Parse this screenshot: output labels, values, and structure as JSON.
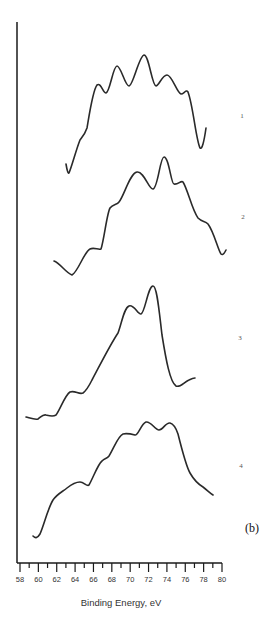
{
  "chart_data": {
    "type": "line",
    "title": "",
    "panel_label": "(b)",
    "xlabel": "Binding Energy, eV",
    "ylabel": "",
    "xlim": [
      58,
      80
    ],
    "x_ticks": [
      58,
      60,
      62,
      64,
      66,
      68,
      70,
      72,
      74,
      76,
      78,
      80
    ],
    "x_minor_step": 1,
    "grid": false,
    "legend": "none (curves labeled 1–4 at right)",
    "y_axis": "relative intensity (arbitrary units, curves vertically offset, no tick labels)",
    "series": [
      {
        "name": "1",
        "x": [
          63.0,
          63.3,
          64.2,
          65.2,
          65.6,
          66.5,
          66.9,
          67.5,
          68.5,
          69.4,
          70.7,
          71.5,
          72.3,
          73.5,
          74.3,
          75.0,
          76.2,
          76.7,
          77.0,
          77.7,
          78.3
        ],
        "y": [
          18,
          16,
          26,
          34,
          50,
          70,
          74,
          71,
          78,
          85,
          77,
          81,
          89,
          78,
          80,
          76,
          71,
          72,
          66,
          49,
          57
        ]
      },
      {
        "name": "2",
        "x": [
          61.7,
          63.6,
          64.3,
          65.6,
          66.8,
          67.6,
          68.5,
          69.5,
          70.5,
          71.6,
          72.7,
          73.1,
          74.6,
          75.2,
          75.9,
          77.4,
          78.5,
          79.1,
          80.0
        ],
        "y": [
          24,
          19,
          23,
          28,
          28,
          44,
          46,
          55,
          58,
          52,
          63,
          63,
          53,
          54,
          44,
          41,
          31,
          30,
          32
        ]
      },
      {
        "name": "3",
        "x": [
          58.7,
          60.0,
          60.8,
          61.8,
          62.0,
          63.4,
          64.6,
          65.7,
          66.7,
          68.6,
          69.8,
          70.2,
          71.3,
          71.7,
          72.5,
          73.2,
          75.0,
          76.4,
          76.6
        ],
        "y": [
          3,
          2,
          4,
          4,
          5,
          14,
          13,
          17,
          25,
          40,
          49,
          51,
          48,
          59,
          54,
          34,
          18,
          21,
          22
        ]
      },
      {
        "name": "4",
        "x": [
          59.4,
          59.9,
          60.2,
          61.5,
          63.0,
          64.5,
          65.5,
          66.9,
          67.6,
          69.1,
          70.3,
          70.7,
          71.7,
          72.9,
          73.9,
          74.6,
          76.4,
          77.6,
          79.0
        ],
        "y": [
          3,
          2,
          16,
          16,
          21,
          24,
          23,
          32,
          34,
          42,
          42,
          41,
          47,
          44,
          47,
          45,
          27,
          22,
          19
        ]
      }
    ]
  },
  "labels": {
    "curve_1": "1",
    "curve_2": "2",
    "curve_3": "3",
    "curve_4": "4",
    "panel": "(b)",
    "xlabel": "Binding Energy, eV",
    "ticks": [
      "58",
      "60",
      "62",
      "64",
      "66",
      "68",
      "70",
      "72",
      "74",
      "76",
      "78",
      "80"
    ]
  }
}
